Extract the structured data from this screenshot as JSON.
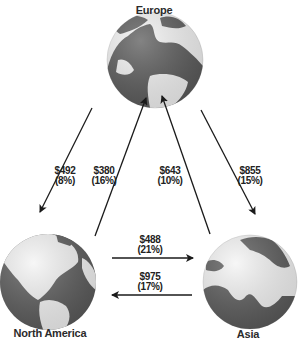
{
  "regions": {
    "europe": {
      "label": "Europe"
    },
    "north_america": {
      "label": "North America"
    },
    "asia": {
      "label": "Asia"
    }
  },
  "flows": [
    {
      "from": "Europe",
      "to": "North America",
      "amount": "$492",
      "share": "(8%)"
    },
    {
      "from": "North America",
      "to": "Europe",
      "amount": "$380",
      "share": "(16%)"
    },
    {
      "from": "Asia",
      "to": "Europe",
      "amount": "$643",
      "share": "(10%)"
    },
    {
      "from": "Europe",
      "to": "Asia",
      "amount": "$855",
      "share": "(15%)"
    },
    {
      "from": "North America",
      "to": "Asia",
      "amount": "$488",
      "share": "(21%)"
    },
    {
      "from": "Asia",
      "to": "North America",
      "amount": "$975",
      "share": "(17%)"
    }
  ],
  "colors": {
    "globe_land": "#5a5a5a",
    "globe_ocean": "#f4f4f4",
    "arrow": "#1a1a1a"
  }
}
